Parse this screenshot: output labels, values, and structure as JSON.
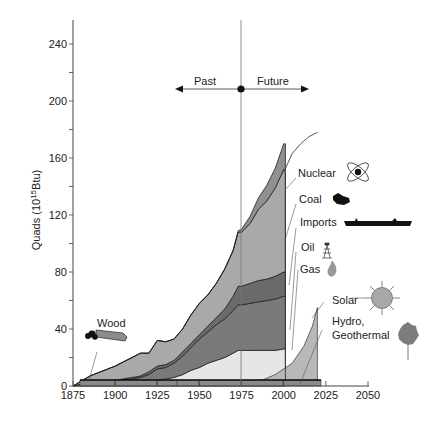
{
  "chart_data": {
    "type": "area",
    "title": "",
    "xlabel": "",
    "ylabel": "Quads (10^15 Btu)",
    "ylabel_parts": {
      "main": "Quads (10",
      "sup": "15",
      "tail": "Btu)"
    },
    "xlim": [
      1875,
      2050
    ],
    "ylim": [
      0,
      260
    ],
    "x_ticks": [
      1875,
      1900,
      1925,
      1950,
      1975,
      2000,
      2025,
      2050
    ],
    "y_ticks": [
      0,
      40,
      80,
      120,
      160,
      200,
      240
    ],
    "grid": false,
    "divider": {
      "year": 1975,
      "left_label": "Past",
      "right_label": "Future"
    },
    "x": [
      1875,
      1885,
      1900,
      1910,
      1915,
      1920,
      1925,
      1930,
      1935,
      1940,
      1945,
      1950,
      1955,
      1960,
      1965,
      1970,
      1973,
      1975,
      1980,
      1985,
      1990,
      1995,
      2000,
      2001
    ],
    "series": [
      {
        "name": "Wood",
        "color": "#8a8a8a",
        "values": [
          0,
          3,
          3,
          3,
          3,
          3,
          3,
          3,
          3,
          3,
          3,
          3,
          3,
          3,
          3,
          3,
          3,
          3,
          3,
          3,
          3,
          3,
          3,
          3
        ]
      },
      {
        "name": "Gas",
        "color": "#e6e6e6",
        "values": [
          0,
          0,
          0,
          0,
          0,
          0,
          1,
          2,
          3,
          5,
          8,
          10,
          13,
          15,
          17,
          20,
          22,
          22,
          22,
          22,
          22,
          22,
          23,
          23
        ]
      },
      {
        "name": "Oil",
        "color": "#7a7a7a",
        "values": [
          0,
          0,
          1,
          2,
          3,
          5,
          8,
          8,
          10,
          13,
          16,
          20,
          22,
          25,
          27,
          30,
          32,
          32,
          33,
          34,
          35,
          36,
          37,
          37
        ]
      },
      {
        "name": "Imports",
        "color": "#6a6a6a",
        "values": [
          0,
          0,
          0,
          1,
          1,
          2,
          2,
          2,
          2,
          3,
          3,
          3,
          4,
          5,
          7,
          10,
          13,
          13,
          14,
          15,
          15,
          16,
          17,
          17
        ]
      },
      {
        "name": "Coal",
        "color": "#a9a9a9",
        "values": [
          0,
          4,
          10,
          14,
          16,
          13,
          18,
          16,
          15,
          16,
          20,
          22,
          22,
          24,
          28,
          32,
          38,
          38,
          42,
          50,
          55,
          62,
          72,
          72
        ]
      },
      {
        "name": "Nuclear",
        "color": "#909090",
        "values": [
          0,
          0,
          0,
          0,
          0,
          0,
          0,
          0,
          0,
          0,
          0,
          0,
          0,
          0,
          0,
          0,
          1,
          2,
          5,
          8,
          11,
          14,
          18,
          18
        ]
      }
    ],
    "projection": {
      "name": "Total future",
      "x": [
        2000,
        2005,
        2010,
        2015,
        2020
      ],
      "values": [
        150,
        163,
        170,
        175,
        178
      ]
    },
    "renewables": {
      "name": "Solar / Hydro, Geothermal",
      "color": "#b8b8b8",
      "x": [
        1975,
        1985,
        1995,
        2005,
        2012,
        2017,
        2020
      ],
      "values": [
        0,
        3,
        8,
        16,
        28,
        42,
        55
      ]
    },
    "legend_labels": [
      "Nuclear",
      "Coal",
      "Imports",
      "Oil",
      "Gas",
      "Solar",
      "Hydro,",
      "Geothermal",
      "Wood"
    ]
  },
  "labels": {
    "past": "Past",
    "future": "Future",
    "wood": "Wood",
    "nuclear": "Nuclear",
    "coal": "Coal",
    "imports": "Imports",
    "oil": "Oil",
    "gas": "Gas",
    "solar": "Solar",
    "hydro_line1": "Hydro,",
    "hydro_line2": "Geothermal"
  },
  "icons": {
    "nuclear": "atom-icon",
    "coal": "coal-lump-icon",
    "imports": "tanker-ship-icon",
    "oil": "oil-derrick-icon",
    "gas": "flame-icon",
    "solar": "sun-icon",
    "hydro": "tree-icon",
    "wood": "log-icon"
  }
}
